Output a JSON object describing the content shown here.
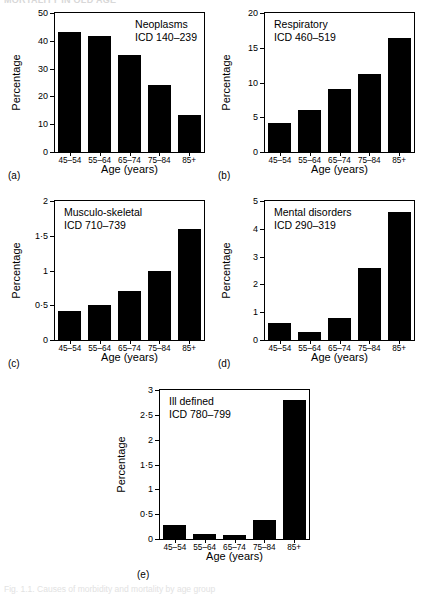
{
  "page": {
    "top_cut_text": "MORTALITY IN OLD AGE",
    "bottom_cut_text": "Fig. 1.1.  Causes of morbidity and mortality by age group"
  },
  "common": {
    "ylabel": "Percentage",
    "xlabel": "Age (years)",
    "categories": [
      "45–54",
      "55–64",
      "65–74",
      "75–84",
      "85+"
    ]
  },
  "chart_data": [
    {
      "type": "bar",
      "panel": "(a)",
      "title": "Neoplasms",
      "subtitle": "ICD 140–239",
      "categories": [
        "45–54",
        "55–64",
        "65–74",
        "75–84",
        "85+"
      ],
      "values": [
        43,
        41.7,
        35,
        24,
        13.3
      ],
      "xlabel": "Age (years)",
      "ylabel": "Percentage",
      "ylim": [
        0,
        50
      ],
      "yticks": [
        0,
        10,
        20,
        30,
        40,
        50
      ],
      "ytick_labels": [
        "0",
        "10",
        "20",
        "30",
        "40",
        "50"
      ],
      "grid": false,
      "legend": "none",
      "annotation_position": "top-right"
    },
    {
      "type": "bar",
      "panel": "(b)",
      "title": "Respiratory",
      "subtitle": "ICD 460–519",
      "categories": [
        "45–54",
        "55–64",
        "65–74",
        "75–84",
        "85+"
      ],
      "values": [
        4.2,
        6.1,
        9.0,
        11.2,
        16.4
      ],
      "xlabel": "Age (years)",
      "ylabel": "Percentage",
      "ylim": [
        0,
        20
      ],
      "yticks": [
        0,
        5,
        10,
        15,
        20
      ],
      "ytick_labels": [
        "0",
        "5",
        "10",
        "15",
        "20"
      ],
      "grid": false,
      "legend": "none",
      "annotation_position": "top-left"
    },
    {
      "type": "bar",
      "panel": "(c)",
      "title": "Musculo-skeletal",
      "subtitle": "ICD 710–739",
      "categories": [
        "45–54",
        "55–64",
        "65–74",
        "75–84",
        "85+"
      ],
      "values": [
        0.42,
        0.51,
        0.7,
        1.0,
        1.6
      ],
      "xlabel": "Age (years)",
      "ylabel": "Percentage",
      "ylim": [
        0,
        2
      ],
      "yticks": [
        0,
        0.5,
        1,
        1.5,
        2
      ],
      "ytick_labels": [
        "0",
        "0·5",
        "1",
        "1·5",
        "2"
      ],
      "grid": false,
      "legend": "none",
      "annotation_position": "top-left"
    },
    {
      "type": "bar",
      "panel": "(d)",
      "title": "Mental disorders",
      "subtitle": "ICD 290–319",
      "categories": [
        "45–54",
        "55–64",
        "65–74",
        "75–84",
        "85+"
      ],
      "values": [
        0.6,
        0.3,
        0.8,
        2.6,
        4.6
      ],
      "xlabel": "Age (years)",
      "ylabel": "Percentage",
      "ylim": [
        0,
        5
      ],
      "yticks": [
        0,
        1,
        2,
        3,
        4,
        5
      ],
      "ytick_labels": [
        "0",
        "1",
        "2",
        "3",
        "4",
        "5"
      ],
      "grid": false,
      "legend": "none",
      "annotation_position": "top-left"
    },
    {
      "type": "bar",
      "panel": "(e)",
      "title": "Ill defined",
      "subtitle": "ICD 780–799",
      "categories": [
        "45–54",
        "55–64",
        "65–74",
        "75–84",
        "85+"
      ],
      "values": [
        0.29,
        0.1,
        0.09,
        0.38,
        2.8
      ],
      "xlabel": "Age (years)",
      "ylabel": "Percentage",
      "ylim": [
        0,
        3
      ],
      "yticks": [
        0,
        0.5,
        1,
        1.5,
        2,
        2.5,
        3
      ],
      "ytick_labels": [
        "0",
        "0·5",
        "1",
        "1·5",
        "2",
        "2·5",
        "3"
      ],
      "grid": false,
      "legend": "none",
      "annotation_position": "top-left"
    }
  ]
}
